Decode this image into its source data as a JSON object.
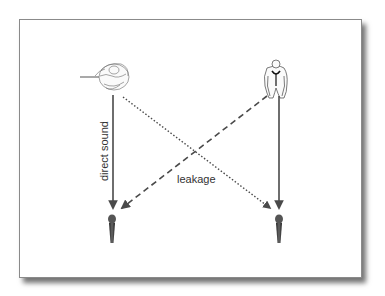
{
  "diagram": {
    "title": "",
    "labels": {
      "direct_sound": "direct sound",
      "leakage": "leakage"
    },
    "nodes": [
      {
        "id": "flute-player",
        "type": "musician-icon",
        "instrument": "flute",
        "position": "top-left"
      },
      {
        "id": "performer-right",
        "type": "musician-icon",
        "position": "top-right"
      },
      {
        "id": "mic-left",
        "type": "microphone-icon",
        "position": "bottom-left"
      },
      {
        "id": "mic-right",
        "type": "microphone-icon",
        "position": "bottom-right"
      }
    ],
    "edges": [
      {
        "from": "flute-player",
        "to": "mic-left",
        "style": "solid",
        "label": "direct sound"
      },
      {
        "from": "performer-right",
        "to": "mic-right",
        "style": "solid"
      },
      {
        "from": "flute-player",
        "to": "mic-right",
        "style": "dotted",
        "label": "leakage"
      },
      {
        "from": "performer-right",
        "to": "mic-left",
        "style": "dashed",
        "label": "leakage"
      }
    ],
    "colors": {
      "line": "#4a4a4a",
      "frame_border": "#8a8a8a",
      "mic": "#3a3a3a"
    }
  }
}
